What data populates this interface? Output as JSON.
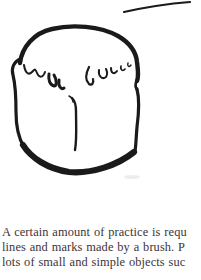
{
  "page": {
    "background_color": "#ffffff",
    "ink_color": "#1a1a1a",
    "text_color": "#3d3337"
  },
  "illustration": {
    "name": "bread-loaf-brush-drawing",
    "description": "black brush-and-ink outline drawing of a loaf of bread with scalloped crust line and center crease"
  },
  "paragraph": {
    "lines": [
      "A certain amount of practice is requ",
      "lines and marks made by a brush. P",
      "lots of small and simple objects suc"
    ]
  }
}
